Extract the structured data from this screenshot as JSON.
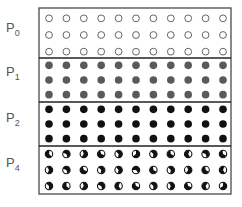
{
  "title": "",
  "colors": {
    "border": "#4a4a4a",
    "empty_stroke": "#666666",
    "p1_fill": "#5a5a5a",
    "p2_fill": "#111111",
    "half_fill": "#111111"
  },
  "grid": {
    "columns": 11,
    "rows_per_section": 3
  },
  "sections": [
    {
      "label": "P",
      "sub": "0",
      "style": "empty",
      "cells": [
        [
          0,
          0,
          0,
          0,
          0,
          0,
          0,
          0,
          0,
          0,
          0
        ],
        [
          0,
          0,
          0,
          0,
          0,
          0,
          0,
          0,
          0,
          0,
          0
        ],
        [
          0,
          0,
          0,
          0,
          0,
          0,
          0,
          0,
          0,
          0,
          0
        ]
      ]
    },
    {
      "label": "P",
      "sub": "1",
      "style": "gray",
      "cells": [
        [
          1,
          1,
          1,
          1,
          1,
          1,
          1,
          1,
          1,
          1,
          1
        ],
        [
          1,
          1,
          1,
          1,
          1,
          1,
          1,
          1,
          1,
          1,
          1
        ],
        [
          1,
          1,
          1,
          1,
          1,
          1,
          1,
          1,
          1,
          1,
          1
        ]
      ]
    },
    {
      "label": "P",
      "sub": "2",
      "style": "black",
      "cells": [
        [
          1,
          1,
          1,
          1,
          1,
          1,
          1,
          1,
          1,
          1,
          1
        ],
        [
          1,
          1,
          1,
          1,
          1,
          1,
          1,
          1,
          1,
          1,
          1
        ],
        [
          1,
          1,
          1,
          1,
          1,
          1,
          1,
          1,
          1,
          1,
          1
        ]
      ]
    },
    {
      "label": "P",
      "sub": "4",
      "style": "mixed",
      "cells": [
        [
          45,
          200,
          250,
          20,
          225,
          270,
          225,
          30,
          60,
          200,
          30
        ],
        [
          240,
          200,
          20,
          225,
          230,
          180,
          30,
          225,
          250,
          30,
          60
        ],
        [
          220,
          40,
          250,
          200,
          60,
          20,
          220,
          240,
          20,
          70,
          270
        ]
      ]
    }
  ]
}
